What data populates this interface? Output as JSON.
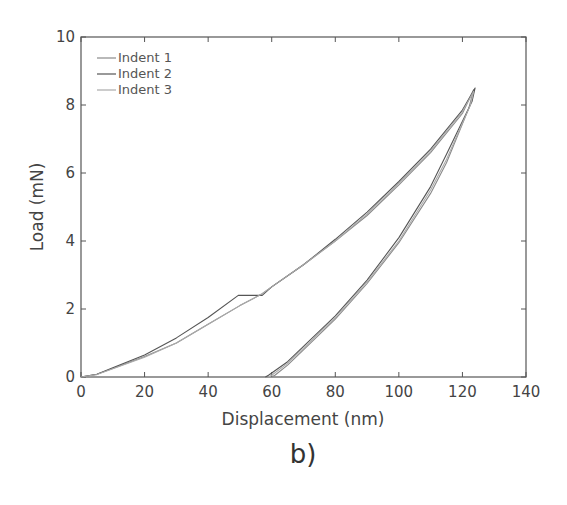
{
  "chart_data": {
    "type": "line",
    "title": "",
    "panel_label": "b)",
    "xlabel": "Displacement (nm)",
    "ylabel": "Load (mN)",
    "xlim": [
      0,
      140
    ],
    "ylim": [
      0,
      10
    ],
    "xticks": [
      0,
      20,
      40,
      60,
      80,
      100,
      120,
      140
    ],
    "xtick_labels": [
      "0",
      "20",
      "40",
      "60",
      "80",
      "100",
      "120",
      "140"
    ],
    "yticks": [
      0,
      2,
      4,
      6,
      8,
      10
    ],
    "ytick_labels": [
      "0",
      "2",
      "4",
      "6",
      "8",
      "10"
    ],
    "grid": false,
    "legend_position": "upper left",
    "series": [
      {
        "name": "Indent 1",
        "color": "#8a8a8a",
        "x": [
          0,
          5,
          10,
          20,
          30,
          40,
          50,
          57,
          60,
          70,
          80,
          90,
          100,
          110,
          120,
          123.5,
          122,
          115,
          110,
          100,
          90,
          80,
          70,
          65,
          61,
          60
        ],
        "y": [
          0,
          0.08,
          0.25,
          0.6,
          1.0,
          1.55,
          2.1,
          2.45,
          2.65,
          3.3,
          4.0,
          4.75,
          5.65,
          6.6,
          7.75,
          8.45,
          7.9,
          6.3,
          5.4,
          3.95,
          2.75,
          1.7,
          0.8,
          0.35,
          0.05,
          0
        ]
      },
      {
        "name": "Indent 2",
        "color": "#555555",
        "x": [
          0,
          5,
          10,
          20,
          30,
          40,
          49.5,
          57,
          60,
          70,
          80,
          90,
          100,
          110,
          120,
          124,
          123,
          115,
          110,
          100,
          90,
          80,
          70,
          65,
          59,
          58
        ],
        "y": [
          0,
          0.08,
          0.27,
          0.65,
          1.15,
          1.75,
          2.4,
          2.4,
          2.65,
          3.3,
          4.05,
          4.85,
          5.75,
          6.7,
          7.85,
          8.5,
          8.1,
          6.55,
          5.6,
          4.1,
          2.85,
          1.8,
          0.9,
          0.45,
          0.05,
          0
        ]
      },
      {
        "name": "Indent 3",
        "color": "#aaaaaa",
        "x": [
          0,
          5,
          10,
          20,
          30,
          40,
          50,
          57,
          60,
          70,
          80,
          90,
          100,
          110,
          120,
          123.5,
          122.5,
          115,
          110,
          100,
          90,
          80,
          70,
          65,
          60,
          59
        ],
        "y": [
          0,
          0.07,
          0.24,
          0.58,
          1.0,
          1.55,
          2.1,
          2.45,
          2.65,
          3.3,
          4.0,
          4.8,
          5.7,
          6.65,
          7.8,
          8.4,
          8.0,
          6.4,
          5.5,
          4.0,
          2.8,
          1.75,
          0.85,
          0.4,
          0.05,
          0
        ]
      }
    ],
    "annotations": [
      "Pop-in event near 50–57 nm at ~2.4 mN (Indent 2)"
    ]
  },
  "legend": {
    "items": [
      {
        "label": "Indent 1",
        "color": "#8a8a8a"
      },
      {
        "label": "Indent 2",
        "color": "#555555"
      },
      {
        "label": "Indent 3",
        "color": "#aaaaaa"
      }
    ]
  }
}
